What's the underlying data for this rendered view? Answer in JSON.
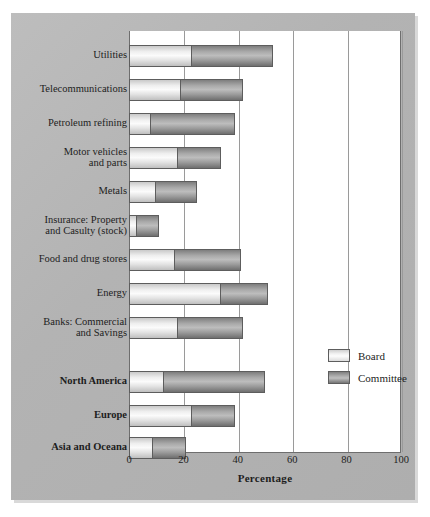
{
  "chart_data": {
    "type": "bar",
    "orientation": "horizontal",
    "stacked": true,
    "title": "",
    "xlabel": "Percentage",
    "ylabel": "",
    "xlim": [
      0,
      100
    ],
    "xticks": [
      "0",
      "20",
      "40",
      "60",
      "80",
      "100"
    ],
    "grid": "vertical",
    "legend_position": "center-right",
    "categories": [
      "Utilities",
      "Telecommunications",
      "Petroleum refining",
      "Motor vehicles and parts",
      "Metals",
      "Insurance: Property and Casulty (stock)",
      "Food and drug stores",
      "Energy",
      "Banks: Commercial and Savings",
      "North America",
      "Europe",
      "Asia and Oceana"
    ],
    "series": [
      {
        "name": "Board",
        "values": [
          23,
          19,
          8,
          18,
          10,
          3,
          17,
          34,
          18,
          13,
          23,
          9
        ]
      },
      {
        "name": "Committee",
        "values": [
          30,
          23,
          31,
          16,
          15,
          8,
          24,
          17,
          24,
          37,
          16,
          12
        ]
      }
    ],
    "totals": [
      53,
      42,
      39,
      34,
      25,
      11,
      41,
      51,
      42,
      50,
      39,
      21
    ]
  },
  "labels": {
    "rows": [
      {
        "lines": [
          "Utilities"
        ],
        "bold": false
      },
      {
        "lines": [
          "Telecommunications"
        ],
        "bold": false
      },
      {
        "lines": [
          "Petroleum refining"
        ],
        "bold": false
      },
      {
        "lines": [
          "Motor vehicles",
          "and parts"
        ],
        "bold": false
      },
      {
        "lines": [
          "Metals"
        ],
        "bold": false
      },
      {
        "lines": [
          "Insurance: Property",
          "and Casulty (stock)"
        ],
        "bold": false
      },
      {
        "lines": [
          "Food and drug stores"
        ],
        "bold": false
      },
      {
        "lines": [
          "Energy"
        ],
        "bold": false
      },
      {
        "lines": [
          "Banks: Commercial",
          "and Savings"
        ],
        "bold": false
      },
      {
        "lines": [
          "North America"
        ],
        "bold": true
      },
      {
        "lines": [
          "Europe"
        ],
        "bold": true
      },
      {
        "lines": [
          "Asia and Oceana"
        ],
        "bold": true
      }
    ]
  },
  "axis": {
    "title": "Percentage",
    "ticks": [
      "0",
      "20",
      "40",
      "60",
      "80",
      "100"
    ]
  },
  "legend": {
    "items": [
      {
        "label": "Board",
        "swatch": "board",
        "color": "#e8e8e8"
      },
      {
        "label": "Committee",
        "swatch": "committee",
        "color": "#9b9b9b"
      }
    ]
  },
  "colors": {
    "panel_background": "#b6b6b6",
    "plot_background": "#ffffff",
    "gridline": "#9a9a9a",
    "axis_line": "#6e6e6e",
    "board_fill": "#ededed",
    "committee_fill": "#a0a0a0",
    "text": "#1d1d1d"
  }
}
